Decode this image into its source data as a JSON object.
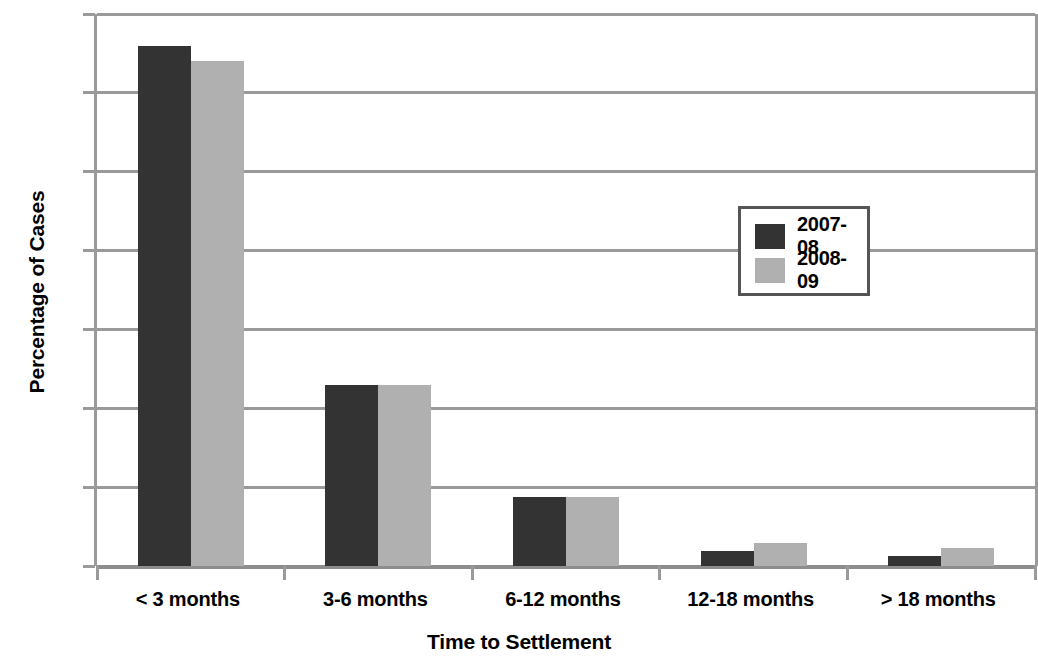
{
  "chart_data": {
    "type": "bar",
    "title": "",
    "xlabel": "Time to Settlement",
    "ylabel": "Percentage of Cases",
    "categories": [
      "< 3 months",
      "3-6 months",
      "6-12 months",
      "12-18 months",
      "> 18 months"
    ],
    "series": [
      {
        "name": "2007-08",
        "values": [
          66,
          23,
          8.8,
          1.9,
          1.3
        ],
        "color": "#333333"
      },
      {
        "name": "2008-09",
        "values": [
          64,
          23,
          8.8,
          2.9,
          2.3
        ],
        "color": "#b0b0b0"
      }
    ],
    "ylim": [
      0,
      70
    ],
    "yticks": [
      0,
      10,
      20,
      30,
      40,
      50,
      60,
      70
    ],
    "ytick_labels": [
      "0",
      "10",
      "20",
      "30",
      "40",
      "50",
      "60",
      "70"
    ],
    "grid": "horizontal",
    "legend_position": "center-right",
    "axis_color": "#9a9a9a",
    "background": "#ffffff"
  },
  "legend": {
    "entries": [
      {
        "label": "2007-08"
      },
      {
        "label": "2008-09"
      }
    ]
  }
}
